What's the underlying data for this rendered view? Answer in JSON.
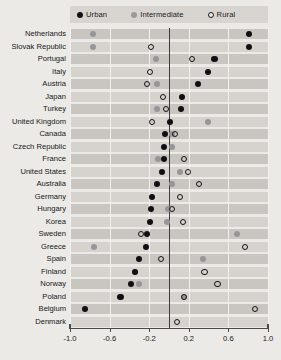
{
  "legend": {
    "items": [
      {
        "key": "urban",
        "label": "Urban",
        "marker": "filled-black-circle-icon"
      },
      {
        "key": "intermediate",
        "label": "Intermediate",
        "marker": "filled-grey-circle-icon"
      },
      {
        "key": "rural",
        "label": "Rural",
        "marker": "hollow-circle-icon"
      }
    ]
  },
  "axis": {
    "ticks": [
      "-1.0",
      "-0.6",
      "-0.2",
      "0.2",
      "0.6",
      "1.0"
    ],
    "tick_values": [
      -1.0,
      -0.6,
      -0.2,
      0.2,
      0.6,
      1.0
    ],
    "min": -1.0,
    "max": 1.0
  },
  "colors": {
    "urban": "#101014",
    "intermediate": "#969698",
    "rural_stroke": "#141416",
    "background": "#eceae6",
    "band": "#c9c6c2",
    "band_alt": "#d6d3cf",
    "zero_line": "#3c3c40",
    "grid": "#f2f0ed"
  },
  "chart_data": {
    "type": "scatter",
    "title": "",
    "subtitle": "",
    "xlabel": "",
    "ylabel": "",
    "xlim": [
      -1.0,
      1.0
    ],
    "grid": true,
    "legend_position": "top",
    "orientation": "horizontal-dot-plot",
    "categories": [
      "Netherlands",
      "Slovak Republic",
      "Portugal",
      "Italy",
      "Austria",
      "Japan",
      "Turkey",
      "United Kingdom",
      "Canada",
      "Czech Republic",
      "France",
      "United States",
      "Australia",
      "Germany",
      "Hungary",
      "Korea",
      "Sweden",
      "Greece",
      "Spain",
      "Finland",
      "Norway",
      "Poland",
      "Belgium",
      "Denmark"
    ],
    "series": [
      {
        "name": "Urban",
        "values": [
          0.81,
          0.81,
          0.46,
          0.39,
          0.29,
          0.13,
          0.12,
          0.01,
          -0.04,
          -0.05,
          -0.05,
          -0.07,
          -0.12,
          -0.17,
          -0.18,
          -0.19,
          -0.22,
          -0.23,
          -0.3,
          -0.34,
          -0.38,
          -0.49,
          -0.85,
          null
        ]
      },
      {
        "name": "Intermediate",
        "values": [
          -0.77,
          -0.77,
          -0.13,
          null,
          -0.12,
          null,
          -0.12,
          0.39,
          0.03,
          0.03,
          -0.11,
          0.11,
          0.03,
          null,
          -0.01,
          -0.02,
          0.69,
          -0.76,
          0.34,
          -0.34,
          -0.3,
          0.15,
          null,
          null
        ]
      },
      {
        "name": "Rural",
        "values": [
          null,
          -0.18,
          0.23,
          -0.19,
          -0.22,
          -0.06,
          -0.03,
          -0.17,
          0.06,
          null,
          0.15,
          0.19,
          0.3,
          0.11,
          0.03,
          0.14,
          -0.28,
          0.77,
          -0.08,
          0.36,
          0.49,
          0.15,
          0.87,
          0.08
        ]
      }
    ]
  }
}
